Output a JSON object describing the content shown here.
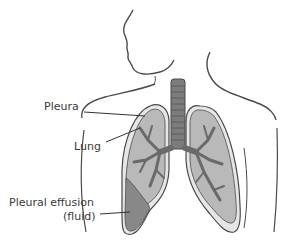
{
  "diagram": {
    "labels": {
      "pleura": "Pleura",
      "lung": "Lung",
      "effusion_line1": "Pleural effusion",
      "effusion_line2": "(fluid)"
    },
    "colors": {
      "outline": "#4a4a4a",
      "lung_fill": "#b9b9b9",
      "pleura_fill": "#e6e6e6",
      "bronchi": "#6a6a6a",
      "fluid": "#888888",
      "trachea": "#7c7c7c"
    }
  }
}
